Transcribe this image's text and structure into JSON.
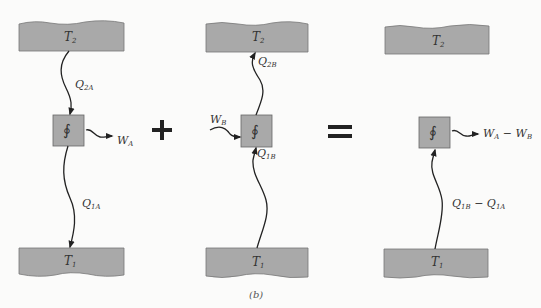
{
  "figure": {
    "caption": "(b)",
    "operators": {
      "plus": "+",
      "equals": "="
    },
    "colors": {
      "reservoir_fill": "#a9a9a9",
      "engine_fill": "#a9a9a9",
      "line": "#222222",
      "background": "#fbfbfa"
    }
  },
  "panels": [
    {
      "id": "engine-A",
      "hot_reservoir": {
        "label": "T",
        "sub": "2"
      },
      "cold_reservoir": {
        "label": "T",
        "sub": "1"
      },
      "engine_symbol": "∮",
      "heat_hot": {
        "label": "Q",
        "sub": "2A",
        "direction": "hot-to-engine"
      },
      "heat_cold": {
        "label": "Q",
        "sub": "1A",
        "direction": "engine-to-cold"
      },
      "work": {
        "label": "W",
        "sub": "A",
        "direction": "out"
      }
    },
    {
      "id": "engine-B",
      "hot_reservoir": {
        "label": "T",
        "sub": "2"
      },
      "cold_reservoir": {
        "label": "T",
        "sub": "1"
      },
      "engine_symbol": "∮",
      "heat_hot": {
        "label": "Q",
        "sub": "2B",
        "direction": "engine-to-hot"
      },
      "heat_cold": {
        "label": "Q",
        "sub": "1B",
        "direction": "cold-to-engine"
      },
      "work": {
        "label": "W",
        "sub": "B",
        "direction": "in"
      }
    },
    {
      "id": "combined",
      "hot_reservoir": {
        "label": "T",
        "sub": "2"
      },
      "cold_reservoir": {
        "label": "T",
        "sub": "1"
      },
      "engine_symbol": "∮",
      "heat_cold": {
        "label": "Q",
        "sub": "1B",
        "minus": " − Q",
        "sub2": "1A",
        "direction": "cold-to-engine"
      },
      "work": {
        "label": "W",
        "sub": "A",
        "minus": " − W",
        "sub2": "B",
        "direction": "out"
      }
    }
  ]
}
